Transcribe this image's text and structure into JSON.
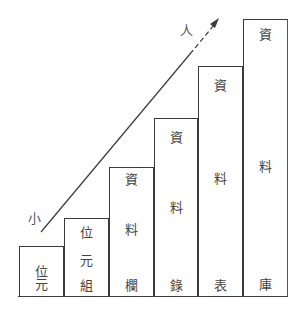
{
  "axis": {
    "small_label": "小",
    "large_label": "人"
  },
  "columns": [
    {
      "name": "bit",
      "chars": [
        "位",
        "元"
      ]
    },
    {
      "name": "byte",
      "chars": [
        "位",
        "元",
        "組"
      ]
    },
    {
      "name": "field",
      "chars": [
        "資",
        "料",
        "欄"
      ]
    },
    {
      "name": "record",
      "chars": [
        "資",
        "料",
        "錄"
      ]
    },
    {
      "name": "table",
      "chars": [
        "資",
        "料",
        "表"
      ]
    },
    {
      "name": "database",
      "chars": [
        "資",
        "料",
        "庫"
      ]
    }
  ],
  "colors": {
    "line": "#3a3a3a",
    "text": "#444444",
    "background": "#ffffff"
  }
}
